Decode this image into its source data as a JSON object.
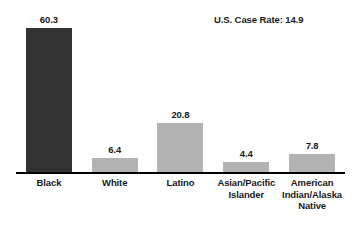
{
  "annotation": {
    "case_rate_text": "U.S. Case Rate: 14.9"
  },
  "colors": {
    "bar_dark": "#333333",
    "bar_light": "#b3b3b3",
    "axis": "#000000",
    "text": "#1a1a1a",
    "background": "#ffffff"
  },
  "chart_data": {
    "type": "bar",
    "title": "",
    "subtitle": "",
    "xlabel": "",
    "ylabel": "",
    "ylim": [
      0,
      68
    ],
    "grid": false,
    "legend": "none",
    "annotations": [
      "U.S. Case Rate: 14.9"
    ],
    "categories": [
      "Black",
      "White",
      "Latino",
      "Asian/Pacific Islander",
      "American Indian/Alaska Native"
    ],
    "values": [
      60.3,
      6.4,
      20.8,
      4.4,
      7.8
    ],
    "value_labels": [
      "60.3",
      "6.4",
      "20.8",
      "4.4",
      "7.8"
    ],
    "bar_colors": [
      "#333333",
      "#b3b3b3",
      "#b3b3b3",
      "#b3b3b3",
      "#b3b3b3"
    ],
    "category_label_lines": [
      [
        "Black"
      ],
      [
        "White"
      ],
      [
        "Latino"
      ],
      [
        "Asian/Pacific",
        "Islander"
      ],
      [
        "American",
        "Indian/Alaska",
        "Native"
      ]
    ]
  }
}
